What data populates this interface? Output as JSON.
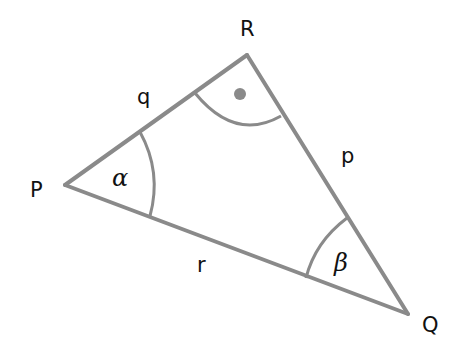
{
  "diagram": {
    "type": "right triangle",
    "colors": {
      "line": "#8a8a8a",
      "text": "#111111",
      "background": "#ffffff"
    },
    "vertices": {
      "P": {
        "label": "P",
        "x": 65,
        "y": 185
      },
      "Q": {
        "label": "Q",
        "x": 408,
        "y": 314
      },
      "R": {
        "label": "R",
        "x": 247,
        "y": 55
      }
    },
    "sides": {
      "q": {
        "label": "q",
        "between": "P-R"
      },
      "p": {
        "label": "p",
        "between": "R-Q"
      },
      "r": {
        "label": "r",
        "between": "P-Q"
      }
    },
    "angles": {
      "alpha": {
        "label": "α",
        "at": "P"
      },
      "beta": {
        "label": "β",
        "at": "Q"
      },
      "right": {
        "label": "",
        "at": "R",
        "marker": "dot"
      }
    }
  }
}
